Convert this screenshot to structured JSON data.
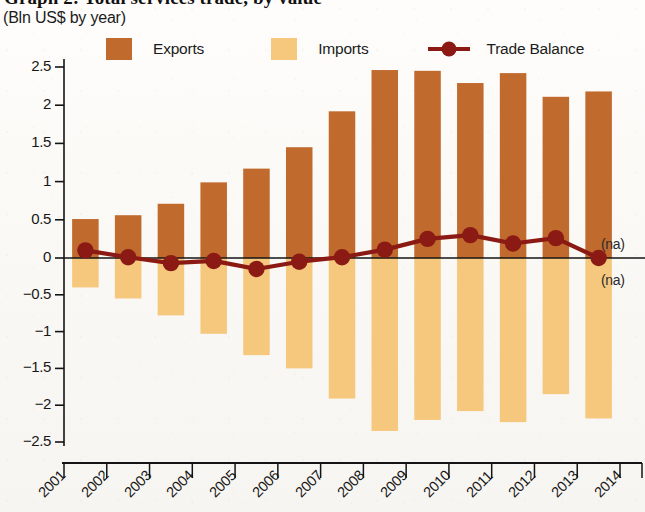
{
  "title": "Graph 2: Total services trade, by value",
  "subtitle": "(Bln US$ by year)",
  "legend": {
    "exports": "Exports",
    "imports": "Imports",
    "balance": "Trade Balance"
  },
  "annotations": {
    "na_above": "(na)",
    "na_below": "(na)"
  },
  "colors": {
    "exports": "#C06A2E",
    "imports": "#F5C87E",
    "balance": "#8B1A14",
    "axis": "#141414",
    "text": "#171717"
  },
  "chart_data": {
    "type": "bar",
    "title": "Graph 2: Total services trade, by value",
    "subtitle": "(Bln US$ by year)",
    "xlabel": "",
    "ylabel": "(Bln US$ by year)",
    "ylim": [
      -2.5,
      2.5
    ],
    "yticks": [
      2.5,
      2,
      1.5,
      1,
      0.5,
      0,
      -0.5,
      -1,
      -1.5,
      -2,
      -2.5
    ],
    "ytick_labels": [
      "2.5",
      "2",
      "1.5",
      "1",
      "0.5",
      "0",
      "−0.5",
      "−1",
      "−1.5",
      "−2",
      "−2.5"
    ],
    "grid": false,
    "legend_position": "top",
    "categories": [
      "2001",
      "2002",
      "2003",
      "2004",
      "2005",
      "2006",
      "2007",
      "2008",
      "2009",
      "2010",
      "2011",
      "2012",
      "2013"
    ],
    "xtick_labels": [
      "2001",
      "2002",
      "2003",
      "2004",
      "2005",
      "2006",
      "2007",
      "2008",
      "2009",
      "2010",
      "2011",
      "2012",
      "2013",
      "2014"
    ],
    "series": [
      {
        "name": "Exports",
        "type": "bar",
        "values": [
          0.51,
          0.56,
          0.71,
          0.99,
          1.17,
          1.45,
          1.92,
          2.46,
          2.45,
          2.29,
          2.42,
          2.11,
          2.18
        ]
      },
      {
        "name": "Imports",
        "type": "bar",
        "values": [
          -0.4,
          -0.55,
          -0.78,
          -1.03,
          -1.32,
          -1.5,
          -1.91,
          -2.35,
          -2.2,
          -2.08,
          -2.23,
          -1.85,
          -2.18
        ]
      },
      {
        "name": "Trade Balance",
        "type": "line",
        "values": [
          0.1,
          0.01,
          -0.07,
          -0.04,
          -0.15,
          -0.05,
          0.01,
          0.11,
          0.25,
          0.3,
          0.19,
          0.26,
          0.0
        ]
      }
    ],
    "annotations": [
      {
        "text": "(na)",
        "x": "2014",
        "y": 0.2
      },
      {
        "text": "(na)",
        "x": "2014",
        "y": -0.2
      }
    ]
  }
}
